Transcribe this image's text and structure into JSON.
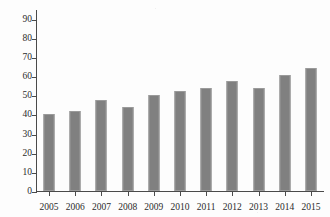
{
  "chart_data": {
    "type": "bar",
    "title": "",
    "subtitle": "",
    "xlabel": "",
    "ylabel": "",
    "categories": [
      "2005",
      "2006",
      "2007",
      "2008",
      "2009",
      "2010",
      "2011",
      "2012",
      "2013",
      "2014",
      "2015"
    ],
    "values": [
      40,
      42,
      47.5,
      44,
      50,
      52,
      54,
      57.5,
      54,
      60.5,
      64
    ],
    "series": [
      {
        "name": "",
        "values": [
          40,
          42,
          47.5,
          44,
          50,
          52,
          54,
          57.5,
          54,
          60.5,
          64
        ]
      }
    ],
    "ylim": [
      0,
      95
    ],
    "ytick_labels": [
      "0",
      "10",
      "20",
      "30",
      "40",
      "50",
      "60",
      "70",
      "80",
      "90"
    ],
    "ytick_values": [
      0,
      10,
      20,
      30,
      40,
      50,
      60,
      70,
      80,
      90
    ],
    "xtick_labels": [
      "2005",
      "2006",
      "2007",
      "2008",
      "2009",
      "2010",
      "2011",
      "2012",
      "2013",
      "2014",
      "2015"
    ],
    "grid": false,
    "legend": false,
    "legend_position": "none",
    "bar_color": "#808080",
    "axis_color": "#4a4a4a",
    "background_color": "#fdfdfd"
  }
}
